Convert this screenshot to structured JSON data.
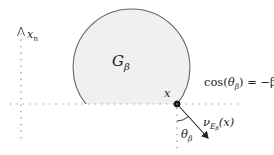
{
  "diagram": {
    "region_label": "G",
    "region_label_sub": "β",
    "axis_label": "x",
    "axis_label_sub": "n",
    "point_label": "x",
    "equation": {
      "prefix": "cos(",
      "theta": "θ",
      "theta_sub": "β",
      "suffix": ") = −β"
    },
    "normal_label": {
      "nu": "ν",
      "E": "E",
      "E_sub": "β",
      "arg": "(x)"
    },
    "angle_label": "θ",
    "angle_label_sub": "β",
    "colors": {
      "region_fill": "#f0f0f0",
      "region_stroke": "#666666",
      "dotted": "#888888",
      "ink": "#222222"
    }
  }
}
